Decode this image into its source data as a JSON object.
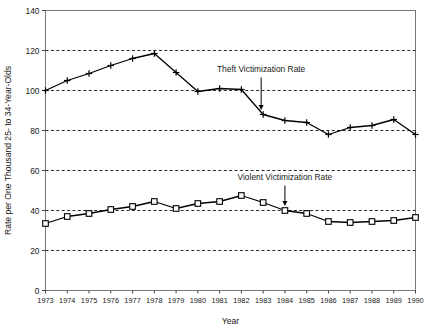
{
  "chart_data": {
    "type": "line",
    "title": "",
    "xlabel": "Year",
    "ylabel": "Rate per One Thousand 25- to 34-Year-Olds",
    "x": [
      1973,
      1974,
      1975,
      1976,
      1977,
      1978,
      1979,
      1980,
      1981,
      1982,
      1983,
      1984,
      1985,
      1986,
      1987,
      1988,
      1989,
      1990
    ],
    "categories": [
      "1973",
      "1974",
      "1975",
      "1976",
      "1977",
      "1978",
      "1979",
      "1980",
      "1981",
      "1982",
      "1983",
      "1984",
      "1985",
      "1986",
      "1987",
      "1988",
      "1989",
      "1990"
    ],
    "xlim": [
      1973,
      1990
    ],
    "ylim": [
      0,
      140
    ],
    "yticks": [
      0,
      20,
      40,
      60,
      80,
      100,
      120,
      140
    ],
    "ytick_labels": [
      "0",
      "20",
      "40",
      "60",
      "80",
      "100",
      "120",
      "140"
    ],
    "grid": true,
    "grid_style": "dashed-horizontal",
    "legend": "none",
    "series": [
      {
        "name": "Theft Victimization Rate",
        "marker": "plus",
        "color": "#000000",
        "values": [
          100.0,
          105.0,
          108.5,
          112.5,
          116.0,
          118.5,
          109.0,
          99.5,
          101.0,
          100.5,
          88.0,
          85.0,
          84.0,
          78.0,
          81.5,
          82.5,
          85.5,
          78.0
        ]
      },
      {
        "name": "Violent Victimization Rate",
        "marker": "square",
        "color": "#000000",
        "values": [
          33.5,
          37.0,
          38.5,
          40.5,
          42.0,
          44.5,
          41.0,
          43.5,
          44.5,
          47.5,
          44.0,
          40.0,
          38.5,
          34.5,
          34.0,
          34.5,
          35.0,
          36.5
        ]
      }
    ],
    "annotations": [
      {
        "text": "Theft Victimization Rate",
        "target_series": "Theft Victimization Rate",
        "target_year": 1983,
        "arrow": "down"
      },
      {
        "text": "Violent Victimization Rate",
        "target_series": "Violent Victimization Rate",
        "target_year": 1984,
        "arrow": "down"
      }
    ]
  }
}
